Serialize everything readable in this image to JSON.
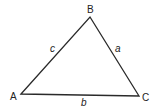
{
  "diagram": {
    "type": "triangle",
    "stroke_color": "#2a2a2a",
    "vertices": {
      "A": {
        "label": "A",
        "x": 21,
        "y": 94
      },
      "B": {
        "label": "B",
        "x": 90,
        "y": 17
      },
      "C": {
        "label": "C",
        "x": 139,
        "y": 96
      }
    },
    "sides": {
      "a": {
        "label": "a",
        "between": "B-C"
      },
      "b": {
        "label": "b",
        "between": "A-C"
      },
      "c": {
        "label": "c",
        "between": "A-B"
      }
    }
  }
}
